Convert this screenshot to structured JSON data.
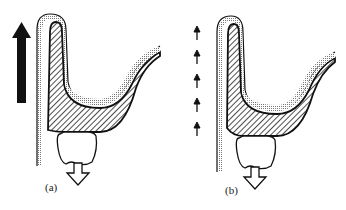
{
  "figure": {
    "panels": [
      {
        "id": "a",
        "label": "(a)",
        "force_indicator": "single-large-solid-arrow-up",
        "tooth_arrow": "hollow-arrow-down"
      },
      {
        "id": "b",
        "label": "(b)",
        "force_indicator": "five-small-arrows-up",
        "tooth_arrow": "hollow-arrow-down",
        "small_arrow_count": 5
      }
    ],
    "colors": {
      "outline": "#111111",
      "hatch": "#333333",
      "stipple": "#888888",
      "background": "#ffffff"
    }
  }
}
